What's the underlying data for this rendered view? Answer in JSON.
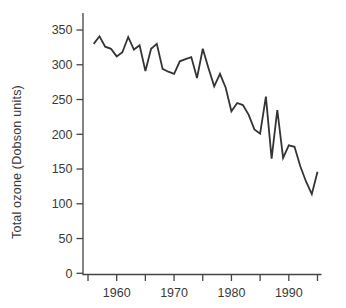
{
  "figure": {
    "background": "#ffffff",
    "line_color": "#343434",
    "axis_color": "#444444",
    "text_color": "#3a3a3a"
  },
  "chart_data": {
    "type": "line",
    "title": "",
    "xlabel": "",
    "ylabel": "Total ozone (Dobson units)",
    "legend": "none",
    "grid": "off",
    "xlim": [
      1954.2,
      1995.7
    ],
    "ylim": [
      0,
      375
    ],
    "y_ticks": [
      0,
      50,
      100,
      150,
      200,
      250,
      300,
      350
    ],
    "x_ticks": [
      1955,
      1960,
      1965,
      1970,
      1975,
      1980,
      1985,
      1990,
      1995
    ],
    "x_tick_labels": [
      1960,
      1970,
      1980,
      1990
    ],
    "x": [
      1956,
      1957,
      1958,
      1959,
      1960,
      1961,
      1962,
      1963,
      1964,
      1965,
      1966,
      1967,
      1968,
      1969,
      1970,
      1971,
      1972,
      1973,
      1974,
      1975,
      1976,
      1977,
      1978,
      1979,
      1980,
      1981,
      1982,
      1983,
      1984,
      1985,
      1986,
      1987,
      1988,
      1989,
      1990,
      1991,
      1992,
      1993,
      1994,
      1995
    ],
    "series": [
      {
        "name": "Total ozone",
        "values": [
          330,
          341,
          326,
          323,
          312,
          318,
          340,
          322,
          328,
          291,
          323,
          330,
          294,
          290,
          287,
          305,
          308,
          311,
          281,
          323,
          295,
          269,
          287,
          267,
          233,
          245,
          242,
          228,
          207,
          201,
          254,
          165,
          235,
          166,
          184,
          182,
          154,
          132,
          114,
          146
        ]
      }
    ]
  }
}
